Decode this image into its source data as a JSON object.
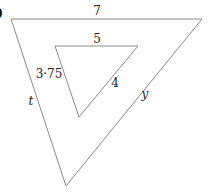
{
  "diagram": {
    "type": "similar-triangles",
    "corner_mark": ")",
    "outer_triangle": {
      "vertices": [
        [
          11,
          19
        ],
        [
          202,
          19
        ],
        [
          66,
          186
        ]
      ],
      "labels": {
        "top": "7",
        "left": "t",
        "right": "y"
      }
    },
    "inner_triangle": {
      "vertices": [
        [
          55,
          46
        ],
        [
          138,
          46
        ],
        [
          79,
          117
        ]
      ],
      "labels": {
        "top": "5",
        "left": "3·75",
        "right": "4"
      }
    },
    "stroke_color": "#8a8a8a",
    "text_color": "#222222"
  }
}
